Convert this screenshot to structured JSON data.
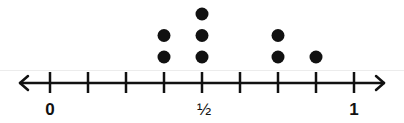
{
  "chart_data": {
    "type": "dot_plot",
    "title": "",
    "xlabel": "",
    "ylabel": "",
    "xlim": [
      0,
      1
    ],
    "tick_step": 0.125,
    "ticks": [
      0,
      0.125,
      0.25,
      0.375,
      0.5,
      0.625,
      0.75,
      0.875,
      1
    ],
    "tick_labels": [
      {
        "value": 0,
        "label": "0"
      },
      {
        "value": 0.5,
        "label": "½"
      },
      {
        "value": 1,
        "label": "1"
      }
    ],
    "categories": [
      "0",
      "1/8",
      "1/4",
      "3/8",
      "1/2",
      "5/8",
      "3/4",
      "7/8",
      "1"
    ],
    "values": [
      0,
      0,
      0,
      2,
      3,
      0,
      2,
      1,
      0
    ],
    "points": [
      {
        "x": 0.375,
        "count": 2
      },
      {
        "x": 0.5,
        "count": 3
      },
      {
        "x": 0.75,
        "count": 2
      },
      {
        "x": 0.875,
        "count": 1
      }
    ],
    "arrows": "both",
    "grid": false,
    "colors": {
      "ink": "#111111",
      "background": "#ffffff"
    }
  },
  "labels": {
    "zero": "0",
    "half": "½",
    "one": "1"
  }
}
